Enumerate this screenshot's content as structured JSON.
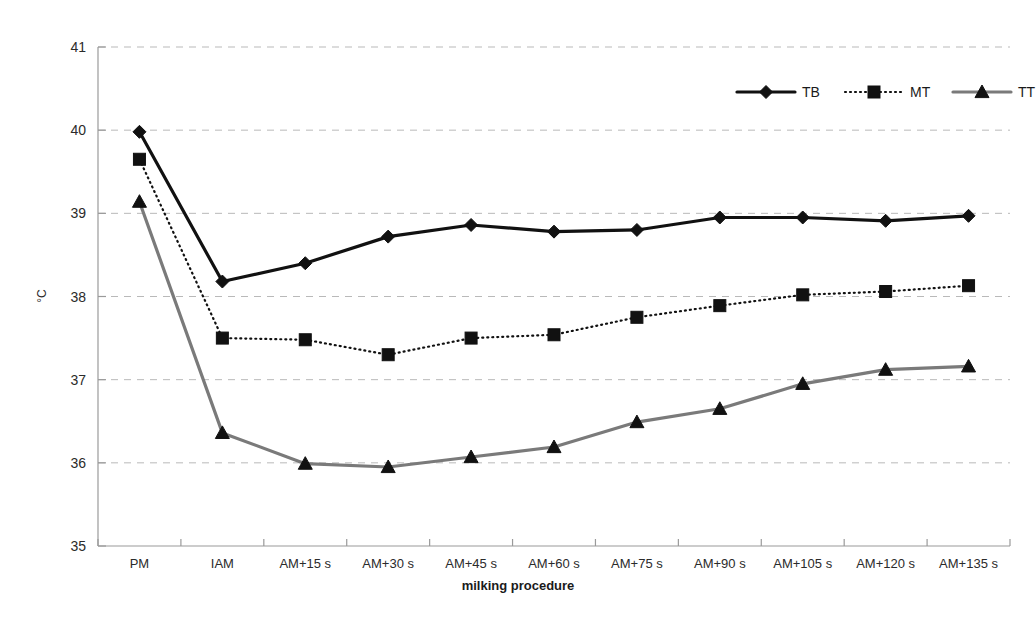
{
  "chart_data": {
    "type": "line",
    "title": "",
    "xlabel": "milking procedure",
    "ylabel": "°C",
    "categories": [
      "PM",
      "IAM",
      "AM+15 s",
      "AM+30 s",
      "AM+45 s",
      "AM+60 s",
      "AM+75 s",
      "AM+90 s",
      "AM+105 s",
      "AM+120 s",
      "AM+135 s"
    ],
    "ylim": [
      35,
      41
    ],
    "yticks": [
      35,
      36,
      37,
      38,
      39,
      40,
      41
    ],
    "ytick_labels": [
      "35",
      "36",
      "37",
      "38",
      "39",
      "40",
      "41"
    ],
    "grid": "horizontal-dashed",
    "legend_position": "top-right",
    "series": [
      {
        "name": "TB",
        "marker": "diamond",
        "line_style": "solid",
        "color": "#111111",
        "values": [
          39.98,
          38.18,
          38.4,
          38.72,
          38.86,
          38.78,
          38.8,
          38.95,
          38.95,
          38.91,
          38.97
        ]
      },
      {
        "name": "MT",
        "marker": "square",
        "line_style": "dotted",
        "color": "#111111",
        "values": [
          39.65,
          37.5,
          37.48,
          37.3,
          37.5,
          37.54,
          37.75,
          37.89,
          38.02,
          38.06,
          38.13
        ]
      },
      {
        "name": "TT",
        "marker": "triangle",
        "line_style": "solid",
        "color": "#7a7a7a",
        "values": [
          39.14,
          36.36,
          35.99,
          35.95,
          36.07,
          36.19,
          36.49,
          36.65,
          36.95,
          37.12,
          37.16
        ]
      }
    ]
  },
  "legend": {
    "entries": [
      {
        "label": "TB"
      },
      {
        "label": "MT"
      },
      {
        "label": "TT"
      }
    ]
  },
  "axes": {
    "x_title": "milking procedure",
    "y_title": "°C"
  },
  "colors": {
    "tb": "#111111",
    "mt": "#111111",
    "tt": "#7a7a7a",
    "grid": "#b9b9b9",
    "axis": "#9a9a9a",
    "background": "#ffffff"
  }
}
